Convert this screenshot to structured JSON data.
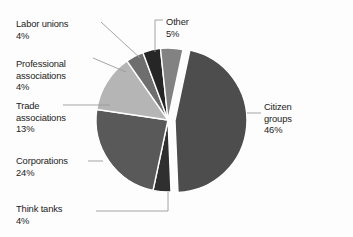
{
  "chart_data": {
    "type": "pie",
    "title": "",
    "subtitle": "",
    "xlabel": "",
    "ylabel": "",
    "legend_position": "none",
    "grid": false,
    "units": "percent",
    "total": 100,
    "exploded_slice": "Citizen groups",
    "categories": [
      "Citizen groups",
      "Corporations",
      "Trade associations",
      "Other",
      "Labor unions",
      "Professional associations",
      "Think tanks"
    ],
    "values": [
      46,
      24,
      13,
      5,
      4,
      4,
      4
    ],
    "slices": [
      {
        "id": "citizen-groups",
        "label": "Citizen groups",
        "value": 46,
        "value_text": "46%",
        "color": "#4d4d4d",
        "exploded": true,
        "start_angle": 12,
        "end_angle": 177.6,
        "label_x": 264,
        "label_y": 101,
        "label_align": "left",
        "leader": [
          [
            247,
            113
          ],
          [
            261,
            113
          ]
        ]
      },
      {
        "id": "think-tanks",
        "label": "Think tanks",
        "value": 4,
        "value_text": "4%",
        "color": "#2f2f2f",
        "exploded": false,
        "start_angle": 177.6,
        "end_angle": 192,
        "label_x": 16,
        "label_y": 203,
        "label_align": "left",
        "leader": [
          [
            168,
            192
          ],
          [
            168,
            211
          ],
          [
            96,
            211
          ]
        ]
      },
      {
        "id": "corporations",
        "label": "Corporations",
        "value": 24,
        "value_text": "24%",
        "color": "#595959",
        "exploded": false,
        "start_angle": 192,
        "end_angle": 278.4,
        "label_x": 16,
        "label_y": 155,
        "label_align": "left",
        "leader": [
          [
            103,
            161
          ],
          [
            88,
            161
          ]
        ]
      },
      {
        "id": "trade-associations",
        "label": "Trade associations",
        "value": 13,
        "value_text": "13%",
        "color": "#b5b5b5",
        "exploded": false,
        "start_angle": 278.4,
        "end_angle": 325.2,
        "label_x": 16,
        "label_y": 100,
        "label_align": "left",
        "leader": [
          [
            110,
            105
          ],
          [
            63,
            105
          ]
        ]
      },
      {
        "id": "professional-associations",
        "label": "Professional associations",
        "value": 4,
        "value_text": "4%",
        "color": "#6e6e6e",
        "exploded": false,
        "start_angle": 325.2,
        "end_angle": 339.6,
        "label_x": 16,
        "label_y": 58,
        "label_align": "left",
        "leader": [
          [
            126,
            72
          ],
          [
            93,
            58
          ]
        ]
      },
      {
        "id": "labor-unions",
        "label": "Labor unions",
        "value": 4,
        "value_text": "4%",
        "color": "#262626",
        "exploded": false,
        "start_angle": 339.6,
        "end_angle": 354,
        "label_x": 16,
        "label_y": 18,
        "label_align": "left",
        "leader": [
          [
            140,
            58
          ],
          [
            101,
            22
          ]
        ]
      },
      {
        "id": "other",
        "label": "Other",
        "value": 5,
        "value_text": "5%",
        "color": "#828282",
        "exploded": false,
        "start_angle": 354,
        "end_angle": 12,
        "label_x": 166,
        "label_y": 16,
        "label_align": "left",
        "leader": [
          [
            155,
            52
          ],
          [
            155,
            20
          ],
          [
            163,
            20
          ]
        ]
      }
    ],
    "geometry": {
      "center_x": 168,
      "center_y": 120,
      "radius": 72,
      "explode_offset": 7
    },
    "colors": {
      "background": "#fdfdfd",
      "leader_line": "#9a9a9a",
      "slice_border": "#ffffff",
      "text": "#1c1c1c"
    }
  }
}
